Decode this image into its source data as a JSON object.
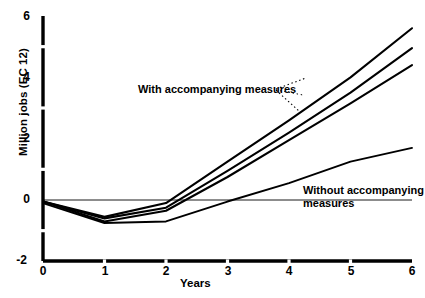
{
  "chart_data": {
    "type": "line",
    "title": "",
    "subtitle": "",
    "xlabel": "Years",
    "ylabel": "Million jobs (EC 12)",
    "xlim": [
      0,
      6
    ],
    "ylim": [
      -2,
      6
    ],
    "x_ticks": [
      "0",
      "1",
      "2",
      "3",
      "4",
      "5",
      "6"
    ],
    "y_ticks": [
      "-2",
      "0",
      "2",
      "4",
      "6"
    ],
    "y_minor_ticks": [
      "-1",
      "1",
      "3",
      "5"
    ],
    "grid": false,
    "legend_position": "inline-annotations",
    "zero_line": true,
    "annotations": [
      {
        "id": "with-measures",
        "text": "With accompanying measures",
        "leader": "dotted",
        "points_to": "upper-curves"
      },
      {
        "id": "without-measures",
        "line1": "Without accompanying",
        "line2": "measures",
        "leader": "none",
        "points_to": "lower-curve"
      }
    ],
    "x": [
      0,
      1,
      2,
      3,
      4,
      5,
      6
    ],
    "series": [
      {
        "name": "With accompanying measures - scenario A",
        "group": "with",
        "values": [
          -0.05,
          -0.55,
          -0.1,
          1.25,
          2.6,
          4.0,
          5.6
        ]
      },
      {
        "name": "With accompanying measures - scenario B",
        "group": "with",
        "values": [
          -0.05,
          -0.6,
          -0.25,
          0.95,
          2.2,
          3.5,
          4.95
        ]
      },
      {
        "name": "With accompanying measures - scenario C",
        "group": "with",
        "values": [
          -0.05,
          -0.7,
          -0.35,
          0.75,
          1.95,
          3.15,
          4.4
        ]
      },
      {
        "name": "Without accompanying measures",
        "group": "without",
        "values": [
          -0.1,
          -0.75,
          -0.7,
          -0.05,
          0.55,
          1.25,
          1.7
        ]
      }
    ],
    "colors": {
      "line": "#000000",
      "axis": "#000000",
      "background": "#ffffff",
      "zero_line": "#000000"
    }
  }
}
